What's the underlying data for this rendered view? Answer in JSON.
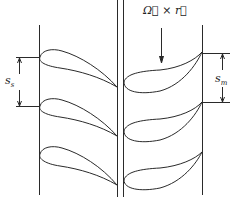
{
  "diagram": {
    "labels": {
      "stator_pitch": "s",
      "stator_pitch_sub": "s",
      "rotor_pitch": "s",
      "rotor_pitch_sub": "m",
      "rotation_vector": "Ω⃗ × r⃗"
    },
    "stator": {
      "blade_count": 3,
      "leading_edge_y": [
        57,
        106,
        154
      ],
      "trailing_edge_y": [
        87,
        136,
        185
      ]
    },
    "rotor": {
      "blade_count": 3,
      "leading_edge_y": [
        82,
        131,
        180
      ],
      "trailing_edge_y": [
        52,
        102,
        152
      ]
    },
    "colors": {
      "stroke": "#2a2a2a",
      "background": "#ffffff"
    }
  }
}
